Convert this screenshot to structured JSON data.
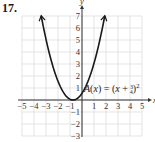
{
  "problem": {
    "number": "17."
  },
  "chart_data": {
    "type": "line",
    "title": "",
    "function_label": "A(x) = (x + 3/4)^2",
    "function_label_parts": {
      "lhs": "A(x) = (x + ",
      "frac_num": "3",
      "frac_den": "4",
      "rhs": ")",
      "exp": "2"
    },
    "xlabel": "x",
    "ylabel": "y",
    "xlim": [
      -5,
      5
    ],
    "ylim": [
      -3,
      7
    ],
    "grid": true,
    "x_ticks": [
      "-5",
      "-4",
      "-3",
      "-2",
      "-1",
      "1",
      "2",
      "3",
      "4",
      "5"
    ],
    "y_ticks": [
      "7",
      "6",
      "5",
      "4",
      "3",
      "2",
      "1",
      "-1",
      "-2",
      "-3"
    ],
    "series": [
      {
        "name": "A(x) = (x + 3/4)^2",
        "vertex": [
          -0.75,
          0
        ],
        "x": [
          -3.4,
          -3,
          -2.5,
          -2,
          -1.5,
          -1,
          -0.75,
          -0.5,
          0,
          0.5,
          1,
          1.5,
          1.9
        ],
        "y": [
          7.02,
          5.06,
          3.06,
          1.56,
          0.56,
          0.06,
          0,
          0.06,
          0.56,
          1.56,
          3.06,
          5.06,
          7.02
        ],
        "arrows": "both-ends"
      }
    ],
    "colors": {
      "curve": "#1a1a1a",
      "grid": "#d8d8d8",
      "axis": "#333333"
    }
  }
}
